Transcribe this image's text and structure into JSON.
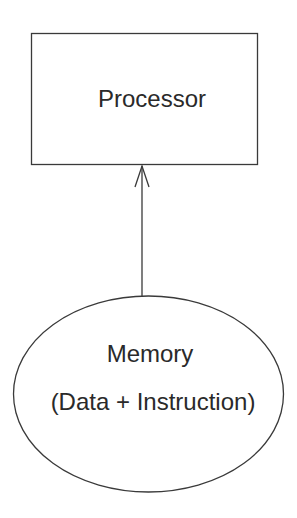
{
  "diagram": {
    "nodes": [
      {
        "id": "processor",
        "shape": "rectangle",
        "label": "Processor"
      },
      {
        "id": "memory",
        "shape": "ellipse",
        "label_line1": "Memory",
        "label_line2": "(Data + Instruction)"
      }
    ],
    "edges": [
      {
        "from": "memory",
        "to": "processor",
        "arrow": "open-arrowhead"
      }
    ],
    "colors": {
      "stroke": "#3a3a3a",
      "text": "#2a2a2a",
      "background": "#ffffff"
    }
  }
}
